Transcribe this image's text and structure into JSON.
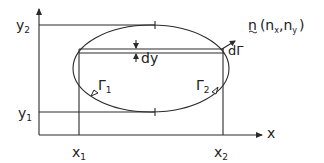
{
  "diagram": {
    "colors": {
      "stroke": "#2a2a2a",
      "background": "#ffffff"
    },
    "axes": {
      "x_label": "x",
      "y_label": ""
    },
    "labels": {
      "y2": "y",
      "y2_sub": "2",
      "y1": "y",
      "y1_sub": "1",
      "x1": "x",
      "x1_sub": "1",
      "x2": "x",
      "x2_sub": "2",
      "dy": "dy",
      "dGamma": "dΓ",
      "gamma1": "Γ",
      "gamma1_sub": "1",
      "gamma2": "Γ",
      "gamma2_sub": "2",
      "normal_vector": "n",
      "normal_components_open": "(n",
      "nx_sub": "x",
      "comma": ",n",
      "ny_sub": "y",
      "normal_components_close": ")"
    }
  }
}
